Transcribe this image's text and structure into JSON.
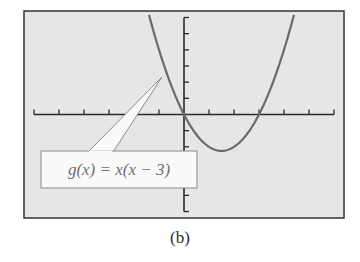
{
  "chart_data": {
    "type": "line",
    "title": "",
    "function": "g(x) = x(x - 3)",
    "series": [
      {
        "name": "g(x) = x(x − 3)",
        "x": [
          -1.4,
          -1,
          -0.5,
          0,
          0.5,
          1,
          1.5,
          2,
          2.5,
          3,
          3.5,
          4,
          4.4
        ],
        "values": [
          6.16,
          4,
          1.75,
          0,
          -1.25,
          -2,
          -2.25,
          -2,
          -1.25,
          0,
          1.75,
          4,
          6.16
        ]
      }
    ],
    "xlim": [
      -6.4,
      6.4
    ],
    "ylim": [
      -6.4,
      6.4
    ],
    "x_ticks": [
      -6,
      -5,
      -4,
      -3,
      -2,
      -1,
      1,
      2,
      3,
      4,
      5,
      6
    ],
    "y_ticks": [
      -6,
      -5,
      -4,
      -3,
      -2,
      -1,
      1,
      2,
      3,
      4,
      5,
      6
    ],
    "xlabel": "",
    "ylabel": "",
    "grid": false,
    "annotations": [
      {
        "text": "g(x) = x(x − 3)",
        "points_to": [
          -0.9,
          2.3
        ]
      }
    ],
    "colors": {
      "background": "#e6e6e6",
      "frame": "#333333",
      "axes": "#2b2b2b",
      "curve": "#6a6a6a",
      "callout_fill": "#fafafa",
      "callout_border": "#8a8a8a"
    }
  },
  "labels": {
    "callout": "g(x) = x(x − 3)",
    "caption": "(b)"
  }
}
